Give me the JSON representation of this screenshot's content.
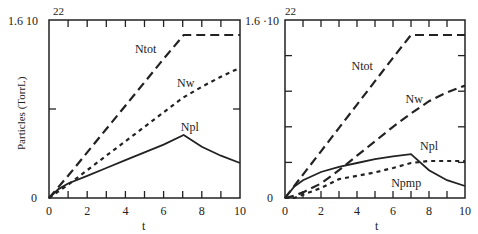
{
  "chart_data": [
    {
      "type": "line",
      "panel": "left",
      "ylabel": "Particles (TorrL)",
      "xlabel": "t",
      "y_top_label": "1.6 10",
      "y_exponent": "22",
      "y_bottom_label": "0",
      "xlim": [
        0,
        10
      ],
      "ylim": [
        0,
        1.6
      ],
      "y_scale": "1e22",
      "x_ticks": [
        0,
        2,
        4,
        6,
        8,
        10
      ],
      "y_ticks": [
        0.8
      ],
      "grid": false,
      "series": [
        {
          "name": "Ntot",
          "style": "long-dash",
          "x": [
            0,
            1,
            2,
            3,
            4,
            5,
            6,
            7.05,
            10
          ],
          "y": [
            0,
            0.2,
            0.41,
            0.62,
            0.83,
            1.04,
            1.25,
            1.465,
            1.465
          ],
          "label_at": [
            4.5,
            1.3
          ]
        },
        {
          "name": "Nw",
          "style": "short-dash",
          "x": [
            0,
            1,
            2,
            3,
            4,
            5,
            6,
            7,
            8,
            9,
            10
          ],
          "y": [
            0,
            0.12,
            0.25,
            0.38,
            0.51,
            0.64,
            0.77,
            0.9,
            1.0,
            1.09,
            1.17
          ],
          "label_at": [
            6.7,
            1.0
          ]
        },
        {
          "name": "Npl",
          "style": "solid",
          "x": [
            0,
            0.5,
            1,
            2,
            3,
            4,
            5,
            6,
            7.05,
            8,
            9,
            10
          ],
          "y": [
            0,
            0.08,
            0.13,
            0.2,
            0.27,
            0.34,
            0.41,
            0.48,
            0.566,
            0.46,
            0.38,
            0.315
          ],
          "label_at": [
            6.9,
            0.6
          ]
        }
      ]
    },
    {
      "type": "line",
      "panel": "right",
      "xlabel": "t",
      "y_top_label": "1.6 ·10",
      "y_exponent": "22",
      "y_bottom_label": "0",
      "xlim": [
        0,
        10
      ],
      "ylim": [
        0,
        1.6
      ],
      "y_scale": "1e22",
      "x_ticks": [
        0,
        2,
        4,
        6,
        8,
        10
      ],
      "y_ticks": [
        0.32,
        0.64,
        0.96,
        1.28
      ],
      "grid": false,
      "series": [
        {
          "name": "Ntot",
          "style": "long-dash",
          "x": [
            0,
            1,
            2,
            3,
            4,
            5,
            6,
            7.0,
            10
          ],
          "y": [
            0,
            0.21,
            0.42,
            0.63,
            0.84,
            1.05,
            1.26,
            1.465,
            1.465
          ],
          "label_at": [
            3.7,
            1.15
          ]
        },
        {
          "name": "Nw",
          "style": "long-dash",
          "x": [
            0,
            0.5,
            1,
            2,
            3,
            4,
            5,
            6,
            7,
            8,
            9,
            10
          ],
          "y": [
            0,
            0.02,
            0.05,
            0.13,
            0.25,
            0.38,
            0.51,
            0.64,
            0.76,
            0.87,
            0.95,
            1.01
          ],
          "label_at": [
            6.7,
            0.85
          ]
        },
        {
          "name": "Npl",
          "style": "solid",
          "x": [
            0,
            0.5,
            1,
            2,
            3,
            4,
            5,
            6,
            7.0,
            8,
            9,
            10
          ],
          "y": [
            0,
            0.1,
            0.16,
            0.234,
            0.28,
            0.315,
            0.35,
            0.375,
            0.395,
            0.25,
            0.16,
            0.108
          ],
          "label_at": [
            7.5,
            0.43
          ]
        },
        {
          "name": "Npmp",
          "style": "short-dash",
          "x": [
            0,
            0.5,
            1,
            2,
            3,
            4,
            5,
            6,
            7.0,
            8,
            9,
            10
          ],
          "y": [
            0,
            0.0,
            0.03,
            0.09,
            0.17,
            0.2,
            0.23,
            0.27,
            0.315,
            0.333,
            0.333,
            0.333
          ],
          "label_at": [
            5.9,
            0.1
          ]
        }
      ]
    }
  ]
}
